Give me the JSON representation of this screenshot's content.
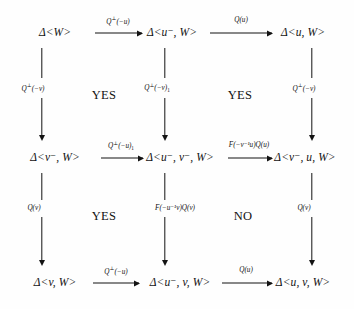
{
  "figure": {
    "kind": "commutative-diagram",
    "rows": 3,
    "columns": 3,
    "background_color": "#fefefe",
    "ink_color": "#131313"
  },
  "nodes": {
    "r1c1": "Δ<W>",
    "r1c2": "Δ<u⁻, W>",
    "r1c3": "Δ<u, W>",
    "r2c1": "Δ<v⁻, W>",
    "r2c2": "Δ<u⁻, v⁻, W>",
    "r2c3": "Δ<v⁻, u, W>",
    "r3c1": "Δ<v, W>",
    "r3c2": "Δ<u⁻, v, W>",
    "r3c3": "Δ<u, v, W>"
  },
  "horizontal_arrows": [
    {
      "id": "h-r1-1",
      "label_base": "Q",
      "label_sup": "⊥",
      "label_arg": "(−u)",
      "label_sub": ""
    },
    {
      "id": "h-r1-2",
      "label_base": "Q",
      "label_sup": "",
      "label_arg": "(u)",
      "label_sub": ""
    },
    {
      "id": "h-r2-1",
      "label_base": "Q",
      "label_sup": "⊥",
      "label_arg": "(−u)",
      "label_sub": "1"
    },
    {
      "id": "h-r2-2",
      "label_base": "F",
      "label_sup": "",
      "label_arg": "(−v⁻¹u)Q(u)",
      "label_sub": ""
    },
    {
      "id": "h-r3-1",
      "label_base": "Q",
      "label_sup": "⊥",
      "label_arg": "(−u)",
      "label_sub": ""
    },
    {
      "id": "h-r3-2",
      "label_base": "Q",
      "label_sup": "",
      "label_arg": "(u)",
      "label_sub": ""
    }
  ],
  "vertical_arrows": [
    {
      "id": "v-c1-1",
      "label_base": "Q",
      "label_sup": "⊥",
      "label_arg": "(−v)",
      "label_sub": ""
    },
    {
      "id": "v-c2-1",
      "label_base": "Q",
      "label_sup": "⊥",
      "label_arg": "(−v)",
      "label_sub": "1"
    },
    {
      "id": "v-c3-1",
      "label_base": "Q",
      "label_sup": "⊥",
      "label_arg": "(−v)",
      "label_sub": ""
    },
    {
      "id": "v-c1-2",
      "label_base": "Q",
      "label_sup": "",
      "label_arg": "(v)",
      "label_sub": ""
    },
    {
      "id": "v-c2-2",
      "label_base": "F",
      "label_sup": "",
      "label_arg": "(−u⁻¹v)Q(v)",
      "label_sub": ""
    },
    {
      "id": "v-c3-2",
      "label_base": "Q",
      "label_sup": "",
      "label_arg": "(v)",
      "label_sub": ""
    }
  ],
  "cell_annotations": [
    {
      "id": "cell-1-1",
      "text": "YES"
    },
    {
      "id": "cell-1-2",
      "text": "YES"
    },
    {
      "id": "cell-2-1",
      "text": "YES"
    },
    {
      "id": "cell-2-2",
      "text": "NO"
    }
  ]
}
